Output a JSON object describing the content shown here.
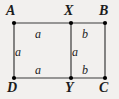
{
  "figure": {
    "kind": "geometry-diagram",
    "background_color": "#f2f0ee",
    "line_color": "#3a3a3a",
    "dot_color": "#000000",
    "text_color": "#1c1c1c"
  },
  "vertices": [
    {
      "id": "A",
      "label": "A",
      "x": 14,
      "y": 23,
      "label_x": 6,
      "label_y": 4
    },
    {
      "id": "X",
      "label": "X",
      "x": 71,
      "y": 23,
      "label_x": 64,
      "label_y": 4
    },
    {
      "id": "B",
      "label": "B",
      "x": 105,
      "y": 23,
      "label_x": 99,
      "label_y": 4
    },
    {
      "id": "D",
      "label": "D",
      "x": 14,
      "y": 78,
      "label_x": 7,
      "label_y": 81
    },
    {
      "id": "Y",
      "label": "Y",
      "x": 71,
      "y": 78,
      "label_x": 65,
      "label_y": 81
    },
    {
      "id": "C",
      "label": "C",
      "x": 105,
      "y": 78,
      "label_x": 99,
      "label_y": 81
    }
  ],
  "edges": [
    {
      "id": "AX",
      "from": "A",
      "to": "X",
      "x1": 14,
      "y1": 23,
      "x2": 71,
      "y2": 23
    },
    {
      "id": "XB",
      "from": "X",
      "to": "B",
      "x1": 71,
      "y1": 23,
      "x2": 105,
      "y2": 23
    },
    {
      "id": "DY",
      "from": "D",
      "to": "Y",
      "x1": 14,
      "y1": 78,
      "x2": 71,
      "y2": 78
    },
    {
      "id": "YC",
      "from": "Y",
      "to": "C",
      "x1": 71,
      "y1": 78,
      "x2": 105,
      "y2": 78
    },
    {
      "id": "AD",
      "from": "A",
      "to": "D",
      "x1": 14,
      "y1": 23,
      "x2": 14,
      "y2": 78
    },
    {
      "id": "XY",
      "from": "X",
      "to": "Y",
      "x1": 71,
      "y1": 23,
      "x2": 71,
      "y2": 78
    },
    {
      "id": "BC",
      "from": "B",
      "to": "C",
      "x1": 105,
      "y1": 23,
      "x2": 105,
      "y2": 78
    }
  ],
  "edge_labels": [
    {
      "id": "len-AX",
      "for_edge": "AX",
      "text": "a",
      "x": 35,
      "y": 28
    },
    {
      "id": "len-XB",
      "for_edge": "XB",
      "text": "b",
      "x": 82,
      "y": 28
    },
    {
      "id": "len-AD",
      "for_edge": "AD",
      "text": "a",
      "x": 15,
      "y": 46
    },
    {
      "id": "len-XY",
      "for_edge": "XY",
      "text": "a",
      "x": 72,
      "y": 46
    },
    {
      "id": "len-DY",
      "for_edge": "DY",
      "text": "a",
      "x": 35,
      "y": 64
    },
    {
      "id": "len-YC",
      "for_edge": "YC",
      "text": "b",
      "x": 82,
      "y": 64
    }
  ]
}
